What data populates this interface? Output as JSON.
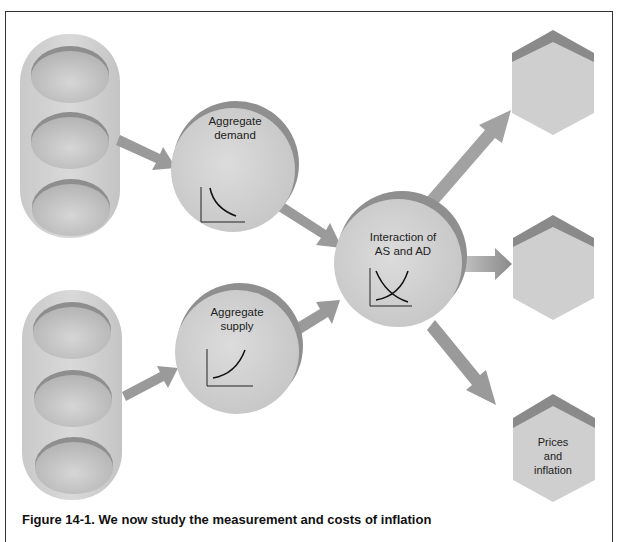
{
  "diagram": {
    "nodes": {
      "aggregate_demand": {
        "line1": "Aggregate",
        "line2": "demand"
      },
      "aggregate_supply": {
        "line1": "Aggregate",
        "line2": "supply"
      },
      "interaction": {
        "line1": "Interaction of",
        "line2": "AS and AD"
      },
      "output_top": {
        "label": ""
      },
      "output_middle": {
        "label": ""
      },
      "output_bottom": {
        "line1": "Prices",
        "line2": "and",
        "line3": "inflation"
      }
    },
    "colors": {
      "shape_fill": "#d2d2d2",
      "shape_shadow": "#8f8f8f",
      "arrow": "#9a9a9a",
      "frame": "#333333"
    }
  },
  "caption": "Figure 14-1. We now study the measurement and costs of inflation"
}
